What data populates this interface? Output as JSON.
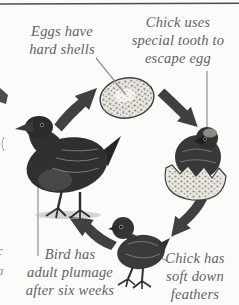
{
  "meta": {
    "width": 239,
    "height": 305
  },
  "diagram": {
    "type": "cycle",
    "labels": {
      "egg": {
        "lines": [
          "Eggs have",
          "hard shells"
        ]
      },
      "hatch": {
        "lines": [
          "Chick uses",
          "special tooth to",
          "escape egg"
        ]
      },
      "adult": {
        "lines": [
          "Bird has",
          "adult plumage",
          "after six weeks"
        ]
      },
      "chick": {
        "lines": [
          "Chick has",
          "soft down",
          "feathers"
        ]
      }
    },
    "stages": [
      "egg",
      "hatching chick",
      "downy chick",
      "adult bird"
    ],
    "colors": {
      "background": "#fbfbf9",
      "label_text": "#5f6266",
      "arrow": "#3e4042",
      "pointer_line": "#8f9094",
      "illustration_ink": "#303030",
      "egg_shell": "#ebe9e2",
      "border_line": "#4a4c4e"
    },
    "edge_fragments": {
      "letters": [
        "c",
        "a"
      ]
    }
  }
}
